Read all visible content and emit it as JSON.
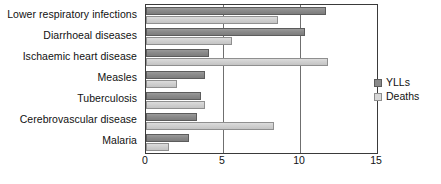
{
  "chart_data": {
    "type": "bar",
    "orientation": "horizontal",
    "title": "",
    "xlabel": "",
    "ylabel": "",
    "xlim": [
      0,
      15
    ],
    "xticks": [
      0,
      5,
      10,
      15
    ],
    "xtick_labels": [
      "0",
      "5",
      "10",
      "15"
    ],
    "grid": true,
    "grid_axis": "x",
    "legend_position": "right",
    "categories": [
      "Lower respiratory infections",
      "Diarrhoeal diseases",
      "Ischaemic heart disease",
      "Measles",
      "Tuberculosis",
      "Cerebrovascular disease",
      "Malaria"
    ],
    "series": [
      {
        "name": "YLLs",
        "color": "#8a8a8a",
        "values": [
          11.7,
          10.3,
          4.1,
          3.8,
          3.6,
          3.3,
          2.8
        ]
      },
      {
        "name": "Deaths",
        "color": "#d0d0d0",
        "values": [
          8.6,
          5.6,
          11.8,
          2.0,
          3.8,
          8.3,
          1.5
        ]
      }
    ]
  },
  "legend": {
    "items": [
      {
        "label": "YLLs"
      },
      {
        "label": "Deaths"
      }
    ]
  },
  "colors": {
    "ylls": "#8a8a8a",
    "deaths": "#d0d0d0",
    "axis": "#3a3a3a",
    "grid": "#6f6f6f",
    "text": "#111111",
    "background": "#ffffff"
  }
}
